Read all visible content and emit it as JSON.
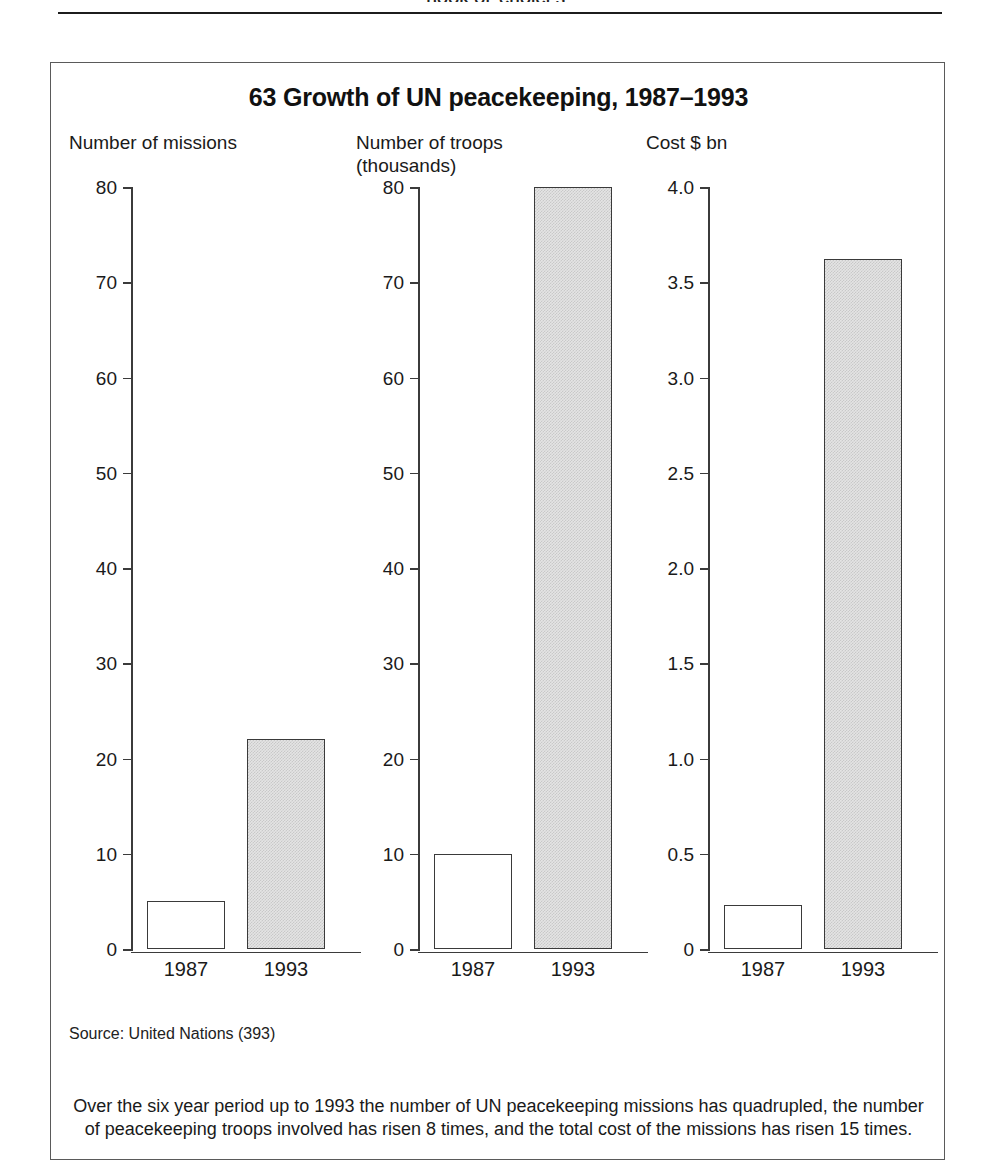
{
  "running_header": "BOOK OF CHOICES",
  "figure": {
    "title": "63 Growth of UN peacekeeping, 1987–1993",
    "source": "Source: United Nations (393)",
    "caption": "Over the six year period up to 1993 the number of UN peacekeeping missions has quadrupled, the number of peacekeeping troops involved has risen 8 times, and the total cost of the missions has risen 15 times."
  },
  "chart_data": [
    {
      "type": "bar",
      "title": "Number of missions",
      "xlabel": "",
      "ylabel": "",
      "categories": [
        "1987",
        "1993"
      ],
      "values": [
        5,
        22
      ],
      "ylim": [
        0,
        80
      ],
      "yticks": [
        0,
        10,
        20,
        30,
        40,
        50,
        60,
        70,
        80
      ],
      "ytick_labels": [
        "0",
        "10",
        "20",
        "30",
        "40",
        "50",
        "60",
        "70",
        "80"
      ],
      "bar_styles": [
        "open",
        "solid"
      ],
      "grid": false,
      "legend": "none"
    },
    {
      "type": "bar",
      "title": "Number of troops\n(thousands)",
      "xlabel": "",
      "ylabel": "",
      "categories": [
        "1987",
        "1993"
      ],
      "values": [
        10,
        80
      ],
      "ylim": [
        0,
        80
      ],
      "yticks": [
        0,
        10,
        20,
        30,
        40,
        50,
        60,
        70,
        80
      ],
      "ytick_labels": [
        "0",
        "10",
        "20",
        "30",
        "40",
        "50",
        "60",
        "70",
        "80"
      ],
      "bar_styles": [
        "open",
        "solid"
      ],
      "grid": false,
      "legend": "none"
    },
    {
      "type": "bar",
      "title": "Cost $ bn",
      "xlabel": "",
      "ylabel": "",
      "categories": [
        "1987",
        "1993"
      ],
      "values": [
        0.23,
        3.62
      ],
      "ylim": [
        0,
        4.0
      ],
      "yticks": [
        0,
        0.5,
        1.0,
        1.5,
        2.0,
        2.5,
        3.0,
        3.5,
        4.0
      ],
      "ytick_labels": [
        "0",
        "0.5",
        "1.0",
        "1.5",
        "2.0",
        "2.5",
        "3.0",
        "3.5",
        "4.0"
      ],
      "bar_styles": [
        "open",
        "solid"
      ],
      "grid": false,
      "legend": "none"
    }
  ],
  "colors": {
    "ink": "#1a1a1a",
    "axis": "#3b3b3b",
    "bar_solid_fill": "#e4e4e4",
    "bar_open_fill": "#ffffff",
    "frame": "#5a5a5a"
  }
}
